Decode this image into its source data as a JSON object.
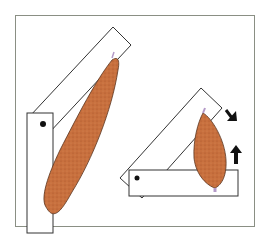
{
  "figure": {
    "colors": {
      "frame": "#8a8f84",
      "bone_outline": "#333333",
      "bone_fill": "#ffffff",
      "muscle_fill": "#c8703e",
      "muscle_outline": "#5a3520",
      "tendon": "#b49ac8",
      "pivot": "#111111",
      "arrow": "#111111"
    },
    "panels": [
      {
        "name": "long-muscle-joint",
        "label": ""
      },
      {
        "name": "short-muscle-joint",
        "label": ""
      }
    ],
    "arrows": [
      {
        "name": "arrow-down",
        "direction": "down"
      },
      {
        "name": "arrow-up",
        "direction": "up"
      }
    ]
  }
}
